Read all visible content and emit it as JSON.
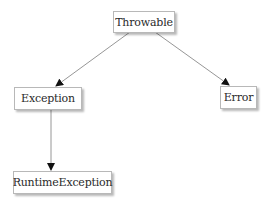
{
  "diagram": {
    "type": "class-hierarchy",
    "nodes": [
      {
        "id": "throwable",
        "label": "Throwable"
      },
      {
        "id": "exception",
        "label": "Exception"
      },
      {
        "id": "error",
        "label": "Error"
      },
      {
        "id": "runtime_exception",
        "label": "RuntimeException"
      }
    ],
    "edges": [
      {
        "from": "throwable",
        "to": "exception"
      },
      {
        "from": "throwable",
        "to": "error"
      },
      {
        "from": "exception",
        "to": "runtime_exception"
      }
    ],
    "colors": {
      "background": "#ffffff",
      "node_border": "#b8b8b8",
      "edge": "#8a8a8a",
      "arrowhead": "#111111",
      "text": "#2a2a2a"
    }
  }
}
